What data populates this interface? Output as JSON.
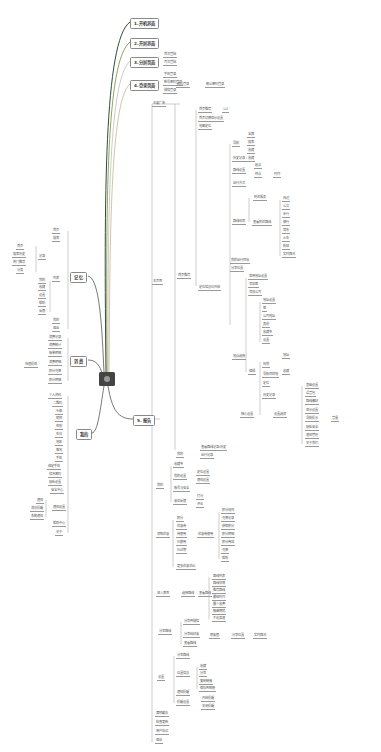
{
  "center": {
    "icon": "central-topic"
  },
  "main_branches": [
    {
      "label": "1.开机界面",
      "x": 130,
      "y": 18,
      "color": "#2f4f3a"
    },
    {
      "label": "2.开屏界面",
      "x": 130,
      "y": 38,
      "color": "#7a8a3a"
    },
    {
      "label": "3.分屏页面",
      "x": 130,
      "y": 57,
      "color": "#aaaaaa"
    },
    {
      "label": "4.登录页面",
      "x": 130,
      "y": 80,
      "color": "#b89a6a"
    },
    {
      "label": "5. 报告",
      "x": 133,
      "y": 415,
      "color": "#555555"
    },
    {
      "label": "记 忆",
      "x": 70,
      "y": 272,
      "color": "#555555"
    },
    {
      "label": "消 费",
      "x": 70,
      "y": 356,
      "color": "#555555"
    },
    {
      "label": "我的",
      "x": 76,
      "y": 429,
      "color": "#555555"
    }
  ],
  "nodes": [
    {
      "t": "首次登陆",
      "x": 163,
      "y": 52
    },
    {
      "t": "再次登陆",
      "x": 163,
      "y": 60
    },
    {
      "t": "手机登录",
      "x": 163,
      "y": 72
    },
    {
      "t": "帐号密码登录",
      "x": 163,
      "y": 80
    },
    {
      "t": "微信登录",
      "x": 163,
      "y": 88
    },
    {
      "t": "确认登录",
      "x": 176,
      "y": 82
    },
    {
      "t": "确认密码登录",
      "x": 205,
      "y": 82
    },
    {
      "t": "主要广告",
      "x": 152,
      "y": 101
    },
    {
      "t": "首页推荐",
      "x": 198,
      "y": 107
    },
    {
      "t": "1/2",
      "x": 222,
      "y": 107
    },
    {
      "t": "首页切换显示设置",
      "x": 198,
      "y": 116
    },
    {
      "t": "地图定位",
      "x": 198,
      "y": 124
    },
    {
      "t": "导航",
      "x": 232,
      "y": 141
    },
    {
      "t": "全屏",
      "x": 247,
      "y": 132
    },
    {
      "t": "搜索",
      "x": 247,
      "y": 140
    },
    {
      "t": "收藏",
      "x": 247,
      "y": 148
    },
    {
      "t": "历史记录 / 收藏",
      "x": 232,
      "y": 156
    },
    {
      "t": "路线设置",
      "x": 232,
      "y": 168
    },
    {
      "t": "起点",
      "x": 254,
      "y": 163
    },
    {
      "t": "终点",
      "x": 254,
      "y": 172
    },
    {
      "t": "时间",
      "x": 273,
      "y": 172
    },
    {
      "t": "出行方式",
      "x": 232,
      "y": 181
    },
    {
      "t": "附近服务",
      "x": 253,
      "y": 195
    },
    {
      "t": "路线规划",
      "x": 232,
      "y": 219
    },
    {
      "t": "查看附近路线",
      "x": 252,
      "y": 220
    },
    {
      "t": "周边",
      "x": 282,
      "y": 196
    },
    {
      "t": "公交",
      "x": 282,
      "y": 204
    },
    {
      "t": "步行",
      "x": 282,
      "y": 212
    },
    {
      "t": "骑行",
      "x": 282,
      "y": 220
    },
    {
      "t": "驾车",
      "x": 282,
      "y": 228
    },
    {
      "t": "火车",
      "x": 282,
      "y": 236
    },
    {
      "t": "航班",
      "x": 282,
      "y": 244
    },
    {
      "t": "实时路况",
      "x": 282,
      "y": 252
    },
    {
      "t": "我的出行目标",
      "x": 230,
      "y": 258
    },
    {
      "t": "分享位置",
      "x": 230,
      "y": 266
    },
    {
      "t": "主页面",
      "x": 152,
      "y": 279
    },
    {
      "t": "首页推荐",
      "x": 177,
      "y": 273
    },
    {
      "t": "定位信息已开启",
      "x": 198,
      "y": 285
    },
    {
      "t": "常用地址设置",
      "x": 248,
      "y": 274
    },
    {
      "t": "添加家",
      "x": 248,
      "y": 282
    },
    {
      "t": "添加公司",
      "x": 248,
      "y": 290
    },
    {
      "t": "地址设置",
      "x": 262,
      "y": 298
    },
    {
      "t": "家",
      "x": 262,
      "y": 306
    },
    {
      "t": "公司地址",
      "x": 262,
      "y": 314
    },
    {
      "t": "其他",
      "x": 262,
      "y": 322
    },
    {
      "t": "收藏夹",
      "x": 262,
      "y": 330
    },
    {
      "t": "设置",
      "x": 262,
      "y": 338
    },
    {
      "t": "地点选择",
      "x": 232,
      "y": 354
    },
    {
      "t": "编辑",
      "x": 248,
      "y": 369
    },
    {
      "t": "规划",
      "x": 262,
      "y": 362
    },
    {
      "t": "地址",
      "x": 282,
      "y": 353
    },
    {
      "t": "导航目的地",
      "x": 262,
      "y": 372
    },
    {
      "t": "收藏",
      "x": 282,
      "y": 369
    },
    {
      "t": "定位",
      "x": 262,
      "y": 381
    },
    {
      "t": "历史记录",
      "x": 262,
      "y": 393
    },
    {
      "t": "核心设置",
      "x": 240,
      "y": 412
    },
    {
      "t": "设置选项",
      "x": 273,
      "y": 412
    },
    {
      "t": "基础设置",
      "x": 305,
      "y": 383
    },
    {
      "t": "语音包",
      "x": 305,
      "y": 391
    },
    {
      "t": "路线偏好",
      "x": 305,
      "y": 399
    },
    {
      "t": "显示设置",
      "x": 305,
      "y": 408
    },
    {
      "t": "导航提示",
      "x": 305,
      "y": 416
    },
    {
      "t": "音量",
      "x": 331,
      "y": 416
    },
    {
      "t": "隐私安全",
      "x": 305,
      "y": 425
    },
    {
      "t": "通知管理",
      "x": 305,
      "y": 433
    },
    {
      "t": "关于我们",
      "x": 305,
      "y": 441
    },
    {
      "t": "查看路线记录/历史",
      "x": 200,
      "y": 445
    },
    {
      "t": "我的",
      "x": 176,
      "y": 452
    },
    {
      "t": "出行记录",
      "x": 200,
      "y": 453
    },
    {
      "t": "收藏夹",
      "x": 173,
      "y": 462
    },
    {
      "t": "我的设置",
      "x": 173,
      "y": 474
    },
    {
      "t": "定位设置",
      "x": 196,
      "y": 470
    },
    {
      "t": "通知设置",
      "x": 196,
      "y": 478
    },
    {
      "t": "我的",
      "x": 156,
      "y": 483
    },
    {
      "t": "账号与安全",
      "x": 173,
      "y": 486
    },
    {
      "t": "意见反馈",
      "x": 173,
      "y": 499
    },
    {
      "t": "打分",
      "x": 196,
      "y": 494
    },
    {
      "t": "评论",
      "x": 196,
      "y": 502
    },
    {
      "t": "积分",
      "x": 176,
      "y": 516
    },
    {
      "t": "优惠券",
      "x": 176,
      "y": 524
    },
    {
      "t": "待使用",
      "x": 176,
      "y": 532
    },
    {
      "t": "已使用",
      "x": 176,
      "y": 540
    },
    {
      "t": "已过期",
      "x": 176,
      "y": 548
    },
    {
      "t": "领取优惠",
      "x": 156,
      "y": 532
    },
    {
      "t": "优惠券使用",
      "x": 197,
      "y": 532
    },
    {
      "t": "积分规则",
      "x": 221,
      "y": 508
    },
    {
      "t": "兑换记录",
      "x": 221,
      "y": 516
    },
    {
      "t": "获取积分",
      "x": 221,
      "y": 524
    },
    {
      "t": "积分明细",
      "x": 221,
      "y": 532
    },
    {
      "t": "积分商城",
      "x": 221,
      "y": 540
    },
    {
      "t": "兑换",
      "x": 221,
      "y": 548
    },
    {
      "t": "帮助",
      "x": 221,
      "y": 556
    },
    {
      "t": "更多优惠活动",
      "x": 176,
      "y": 564
    },
    {
      "t": "进入界面",
      "x": 156,
      "y": 591
    },
    {
      "t": "选择路线",
      "x": 181,
      "y": 591
    },
    {
      "t": "查看路线",
      "x": 198,
      "y": 591
    },
    {
      "t": "路线列表",
      "x": 212,
      "y": 574
    },
    {
      "t": "路线详情",
      "x": 212,
      "y": 581
    },
    {
      "t": "推荐路线",
      "x": 212,
      "y": 588
    },
    {
      "t": "最短时间",
      "x": 212,
      "y": 595
    },
    {
      "t": "最少收费",
      "x": 212,
      "y": 602
    },
    {
      "t": "躲避拥堵",
      "x": 212,
      "y": 609
    },
    {
      "t": "不走高速",
      "x": 212,
      "y": 616
    },
    {
      "t": "分享路线",
      "x": 158,
      "y": 629
    },
    {
      "t": "分享到微信",
      "x": 183,
      "y": 619
    },
    {
      "t": "分享给好友",
      "x": 183,
      "y": 632
    },
    {
      "t": "朋友圈",
      "x": 209,
      "y": 633
    },
    {
      "t": "分享位置",
      "x": 231,
      "y": 633
    },
    {
      "t": "实时路况",
      "x": 253,
      "y": 633
    },
    {
      "t": "查看路线",
      "x": 183,
      "y": 641
    },
    {
      "t": "分享路线",
      "x": 176,
      "y": 653
    },
    {
      "t": "位置信息",
      "x": 176,
      "y": 671
    },
    {
      "t": "收藏",
      "x": 199,
      "y": 664
    },
    {
      "t": "分享",
      "x": 199,
      "y": 671
    },
    {
      "t": "复制链接",
      "x": 199,
      "y": 679
    },
    {
      "t": "保存到相册",
      "x": 199,
      "y": 686
    },
    {
      "t": "设置",
      "x": 157,
      "y": 675
    },
    {
      "t": "通知提醒",
      "x": 176,
      "y": 690
    },
    {
      "t": "提醒设置",
      "x": 176,
      "y": 700
    },
    {
      "t": "开启提醒",
      "x": 201,
      "y": 696
    },
    {
      "t": "关闭提醒",
      "x": 201,
      "y": 704
    },
    {
      "t": "清除缓存",
      "x": 155,
      "y": 711
    },
    {
      "t": "检查更新",
      "x": 155,
      "y": 720
    },
    {
      "t": "用户协议",
      "x": 155,
      "y": 729
    },
    {
      "t": "退出",
      "x": 155,
      "y": 738
    }
  ],
  "left_nodes": [
    {
      "t": "首页",
      "x": 52,
      "y": 228
    },
    {
      "t": "搜索",
      "x": 52,
      "y": 236
    },
    {
      "t": "首页",
      "x": 16,
      "y": 244
    },
    {
      "t": "搜索历史",
      "x": 12,
      "y": 252
    },
    {
      "t": "热门推荐",
      "x": 12,
      "y": 260
    },
    {
      "t": "分类",
      "x": 16,
      "y": 268
    },
    {
      "t": "记录",
      "x": 38,
      "y": 254
    },
    {
      "t": "列表",
      "x": 52,
      "y": 276
    },
    {
      "t": "我的",
      "x": 38,
      "y": 278
    },
    {
      "t": "收藏",
      "x": 38,
      "y": 285
    },
    {
      "t": "设置",
      "x": 38,
      "y": 293
    },
    {
      "t": "帮助",
      "x": 38,
      "y": 301
    },
    {
      "t": "反馈",
      "x": 38,
      "y": 309
    },
    {
      "t": "我的",
      "x": 52,
      "y": 318
    },
    {
      "t": "退出",
      "x": 52,
      "y": 326
    },
    {
      "t": "消费记录",
      "x": 48,
      "y": 335
    },
    {
      "t": "消费统计",
      "x": 48,
      "y": 343
    },
    {
      "t": "账单明细",
      "x": 48,
      "y": 351
    },
    {
      "t": "充值提现",
      "x": 24,
      "y": 362
    },
    {
      "t": "消费明细",
      "x": 48,
      "y": 360
    },
    {
      "t": "积分兑换",
      "x": 48,
      "y": 369
    },
    {
      "t": "积分明细",
      "x": 48,
      "y": 378
    },
    {
      "t": "个人资料",
      "x": 48,
      "y": 393
    },
    {
      "t": "二维码",
      "x": 52,
      "y": 401
    },
    {
      "t": "头像",
      "x": 55,
      "y": 409
    },
    {
      "t": "昵称",
      "x": 55,
      "y": 416
    },
    {
      "t": "性别",
      "x": 55,
      "y": 424
    },
    {
      "t": "生日",
      "x": 55,
      "y": 432
    },
    {
      "t": "地区",
      "x": 55,
      "y": 440
    },
    {
      "t": "签名",
      "x": 55,
      "y": 448
    },
    {
      "t": "手机",
      "x": 55,
      "y": 456
    },
    {
      "t": "绑定手机",
      "x": 47,
      "y": 464
    },
    {
      "t": "修改密码",
      "x": 48,
      "y": 472
    },
    {
      "t": "隐私设置",
      "x": 48,
      "y": 480
    },
    {
      "t": "安全中心",
      "x": 50,
      "y": 488
    },
    {
      "t": "通知",
      "x": 36,
      "y": 498
    },
    {
      "t": "消息提醒",
      "x": 30,
      "y": 506
    },
    {
      "t": "系统通知",
      "x": 30,
      "y": 514
    },
    {
      "t": "通知设置",
      "x": 52,
      "y": 505
    },
    {
      "t": "帮助中心",
      "x": 52,
      "y": 521
    },
    {
      "t": "关于",
      "x": 55,
      "y": 530
    }
  ]
}
